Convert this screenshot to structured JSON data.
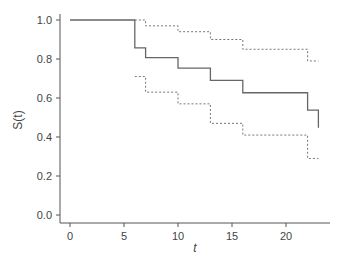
{
  "chart_data": {
    "type": "line",
    "title": "",
    "xlabel": "t",
    "ylabel": "S(t)",
    "xlim": [
      -1,
      24
    ],
    "ylim": [
      0,
      1.0
    ],
    "xticks": [
      0,
      5,
      10,
      15,
      20
    ],
    "yticks": [
      0.0,
      0.2,
      0.4,
      0.6,
      0.8,
      1.0
    ],
    "ytick_labels": [
      "0.0",
      "0.2",
      "0.4",
      "0.6",
      "0.8",
      "1.0"
    ],
    "grid": false,
    "legend": null,
    "series": [
      {
        "name": "Kaplan-Meier estimate",
        "style": "solid-step",
        "x": [
          0,
          6,
          7,
          10,
          13,
          16,
          22,
          23
        ],
        "y": [
          1.0,
          0.857,
          0.807,
          0.753,
          0.69,
          0.627,
          0.538,
          0.448
        ]
      },
      {
        "name": "Upper confidence limit",
        "style": "dotted-step",
        "x": [
          6,
          7,
          10,
          13,
          16,
          22,
          23
        ],
        "y": [
          1.0,
          0.97,
          0.94,
          0.9,
          0.85,
          0.79,
          0.79
        ]
      },
      {
        "name": "Lower confidence limit",
        "style": "dotted-step",
        "x": [
          6,
          7,
          10,
          13,
          16,
          22,
          23
        ],
        "y": [
          0.71,
          0.63,
          0.57,
          0.47,
          0.41,
          0.29,
          0.29
        ]
      }
    ]
  }
}
